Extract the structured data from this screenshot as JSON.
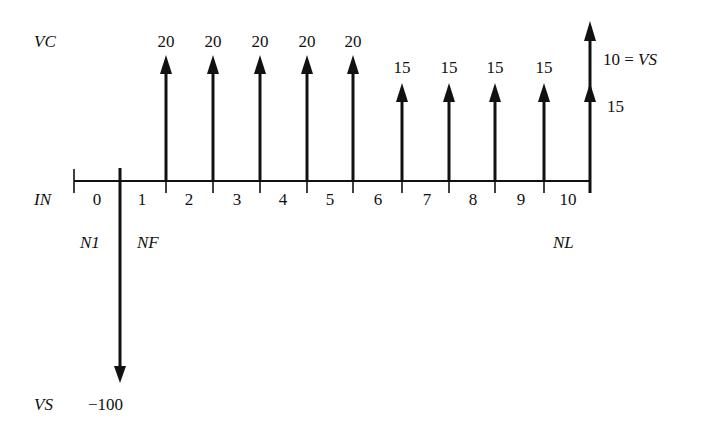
{
  "labels": {
    "vc": "VC",
    "in": "IN",
    "vs_bottom": "VS",
    "n1": "N1",
    "nf": "NF",
    "nl": "NL",
    "investment": "−100",
    "salvage": "10 = VS",
    "final_flow": "15"
  },
  "periods": [
    "0",
    "1",
    "2",
    "3",
    "4",
    "5",
    "6",
    "7",
    "8",
    "9",
    "10"
  ],
  "flow_labels": [
    "20",
    "20",
    "20",
    "20",
    "20",
    "15",
    "15",
    "15",
    "15"
  ],
  "colors": {
    "ink": "#111111",
    "background": "#ffffff"
  },
  "chart_data": {
    "type": "cash-flow-diagram",
    "title": "",
    "row_labels": [
      "VC",
      "IN",
      "VS"
    ],
    "periods": [
      0,
      1,
      2,
      3,
      4,
      5,
      6,
      7,
      8,
      9,
      10
    ],
    "milestones": {
      "N1": 0,
      "NF": 1,
      "NL": 10
    },
    "flows": [
      {
        "time": 0.5,
        "value": -100,
        "label": "-100",
        "kind": "VS"
      },
      {
        "time": 1.5,
        "value": 20,
        "label": "20",
        "kind": "VC"
      },
      {
        "time": 2.5,
        "value": 20,
        "label": "20",
        "kind": "VC"
      },
      {
        "time": 3.5,
        "value": 20,
        "label": "20",
        "kind": "VC"
      },
      {
        "time": 4.5,
        "value": 20,
        "label": "20",
        "kind": "VC"
      },
      {
        "time": 5.5,
        "value": 20,
        "label": "20",
        "kind": "VC"
      },
      {
        "time": 6.5,
        "value": 15,
        "label": "15",
        "kind": "VC"
      },
      {
        "time": 7.5,
        "value": 15,
        "label": "15",
        "kind": "VC"
      },
      {
        "time": 8.5,
        "value": 15,
        "label": "15",
        "kind": "VC"
      },
      {
        "time": 9.5,
        "value": 15,
        "label": "15",
        "kind": "VC"
      },
      {
        "time": 10.5,
        "value": 15,
        "label": "15",
        "kind": "VC"
      },
      {
        "time": 10.5,
        "value": 10,
        "label": "10 = VS",
        "kind": "VS (salvage)"
      }
    ]
  }
}
